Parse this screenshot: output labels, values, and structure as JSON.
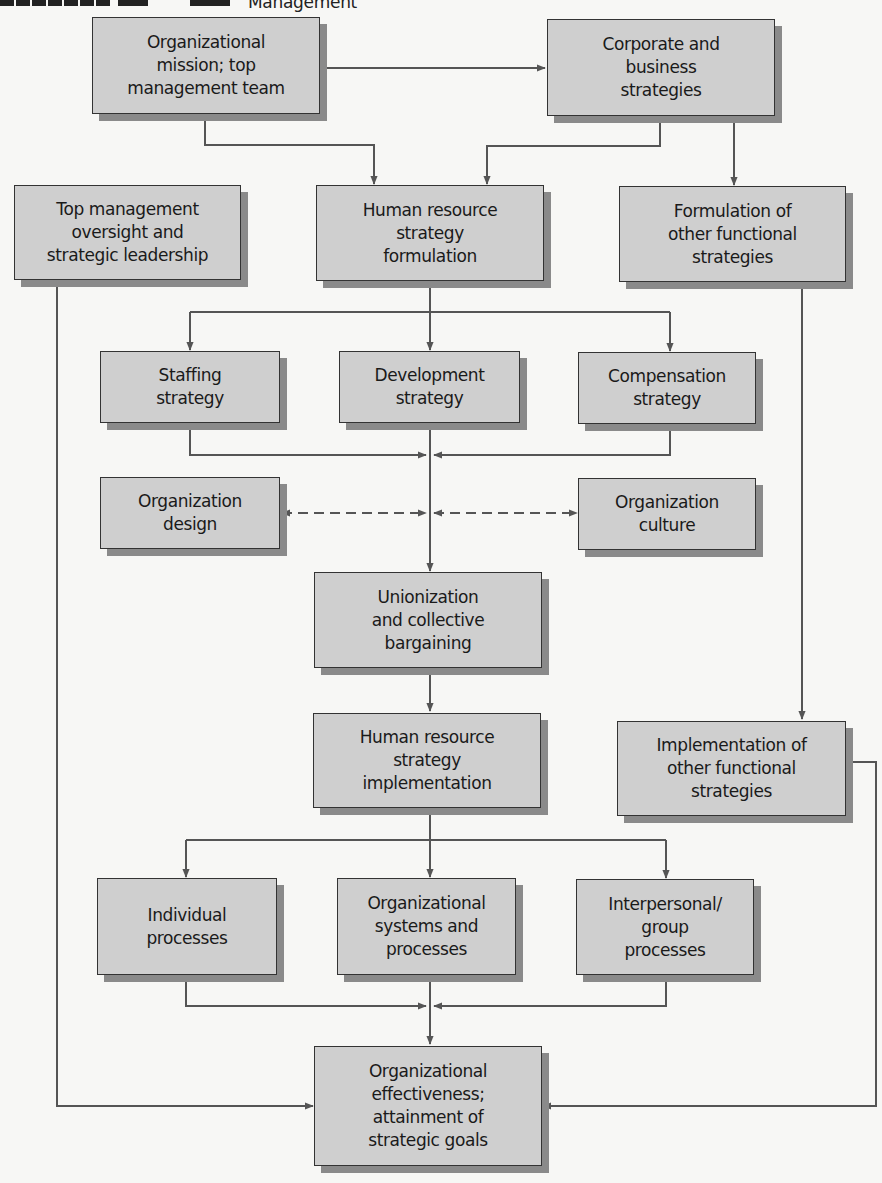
{
  "header": {
    "title": "Management"
  },
  "nodes": {
    "mission": "Organizational\nmission; top\nmanagement team",
    "corporate": "Corporate and\nbusiness\nstrategies",
    "top_mgmt": "Top management\noversight and\nstrategic leadership",
    "hr_formulation": "Human resource\nstrategy\nformulation",
    "other_formulation": "Formulation of\nother functional\nstrategies",
    "staffing": "Staffing\nstrategy",
    "development": "Development\nstrategy",
    "compensation": "Compensation\nstrategy",
    "org_design": "Organization\ndesign",
    "org_culture": "Organization\nculture",
    "unionization": "Unionization\nand collective\nbargaining",
    "hr_implementation": "Human resource\nstrategy\nimplementation",
    "other_implementation": "Implementation of\nother functional\nstrategies",
    "individual": "Individual\nprocesses",
    "org_systems": "Organizational\nsystems and\nprocesses",
    "interpersonal": "Interpersonal/\ngroup\nprocesses",
    "effectiveness": "Organizational\neffectiveness;\nattainment of\nstrategic goals"
  },
  "edges": [
    {
      "from": "mission",
      "to": "corporate",
      "style": "solid"
    },
    {
      "from": "mission",
      "to": "hr_formulation",
      "style": "solid"
    },
    {
      "from": "corporate",
      "to": "hr_formulation",
      "style": "solid"
    },
    {
      "from": "corporate",
      "to": "other_formulation",
      "style": "solid"
    },
    {
      "from": "hr_formulation",
      "to": "staffing",
      "style": "solid"
    },
    {
      "from": "hr_formulation",
      "to": "development",
      "style": "solid"
    },
    {
      "from": "hr_formulation",
      "to": "compensation",
      "style": "solid"
    },
    {
      "from": "staffing",
      "to": "unionization",
      "style": "solid"
    },
    {
      "from": "development",
      "to": "unionization",
      "style": "solid"
    },
    {
      "from": "compensation",
      "to": "unionization",
      "style": "solid"
    },
    {
      "from": "org_design",
      "to": "junction",
      "style": "dashed-bidirectional"
    },
    {
      "from": "org_culture",
      "to": "junction",
      "style": "dashed-bidirectional"
    },
    {
      "from": "unionization",
      "to": "hr_implementation",
      "style": "solid"
    },
    {
      "from": "other_formulation",
      "to": "other_implementation",
      "style": "solid"
    },
    {
      "from": "hr_implementation",
      "to": "individual",
      "style": "solid"
    },
    {
      "from": "hr_implementation",
      "to": "org_systems",
      "style": "solid"
    },
    {
      "from": "hr_implementation",
      "to": "interpersonal",
      "style": "solid"
    },
    {
      "from": "individual",
      "to": "effectiveness",
      "style": "solid"
    },
    {
      "from": "org_systems",
      "to": "effectiveness",
      "style": "solid"
    },
    {
      "from": "interpersonal",
      "to": "effectiveness",
      "style": "solid"
    },
    {
      "from": "top_mgmt",
      "to": "effectiveness",
      "style": "solid"
    },
    {
      "from": "other_implementation",
      "to": "effectiveness",
      "style": "solid"
    }
  ],
  "colors": {
    "box_fill": "#cfcfcf",
    "box_border": "#333333",
    "shadow": "#8a8a8a",
    "line": "#555555",
    "background": "#f7f7f5"
  }
}
